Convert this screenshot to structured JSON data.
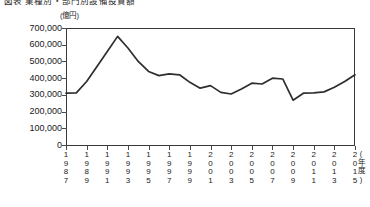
{
  "figure": {
    "title_clipped": "図表 業種別・部門別設備投資額",
    "unit_label": "(億円)",
    "xaxis_name": "(年度)"
  },
  "chart_data": {
    "type": "line",
    "title": "図表 業種別・部門別設備投資額",
    "xlabel": "(年度)",
    "ylabel": "(億円)",
    "ylim": [
      0,
      700000
    ],
    "ytick_step": 100000,
    "ytick_labels": [
      "700,000",
      "600,000",
      "500,000",
      "400,000",
      "300,000",
      "200,000",
      "100,000",
      "0"
    ],
    "ytick_values": [
      700000,
      600000,
      500000,
      400000,
      300000,
      200000,
      100000,
      0
    ],
    "xlim": [
      1987,
      2015
    ],
    "xtick_labels": [
      "1987",
      "1989",
      "1991",
      "1993",
      "1995",
      "1997",
      "1999",
      "2001",
      "2003",
      "2005",
      "2007",
      "2009",
      "2011",
      "2013",
      "2015"
    ],
    "xtick_values": [
      1987,
      1989,
      1991,
      1993,
      1995,
      1997,
      1999,
      2001,
      2003,
      2005,
      2007,
      2009,
      2011,
      2013,
      2015
    ],
    "grid": false,
    "legend": null,
    "series": [
      {
        "name": "設備投資額",
        "color": "#2e2e2e",
        "x": [
          1987,
          1988,
          1989,
          1990,
          1991,
          1992,
          1993,
          1994,
          1995,
          1996,
          1997,
          1998,
          1999,
          2000,
          2001,
          2002,
          2003,
          2004,
          2005,
          2006,
          2007,
          2008,
          2009,
          2010,
          2011,
          2012,
          2013,
          2014,
          2015
        ],
        "values": [
          310000,
          312000,
          380000,
          470000,
          560000,
          650000,
          580000,
          500000,
          440000,
          415000,
          425000,
          420000,
          375000,
          340000,
          355000,
          315000,
          305000,
          335000,
          370000,
          365000,
          400000,
          395000,
          268000,
          310000,
          312000,
          318000,
          345000,
          380000,
          420000
        ]
      }
    ]
  }
}
